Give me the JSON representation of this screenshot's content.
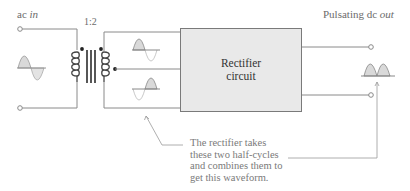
{
  "diagram": {
    "input_label": {
      "prefix": "ac ",
      "italic": "in"
    },
    "output_label": {
      "prefix": "Pulsating dc ",
      "italic": "out"
    },
    "transformer_ratio": "1:2",
    "rectifier": {
      "line1": "Rectifier",
      "line2": "circuit"
    },
    "annotation": [
      "The rectifier takes",
      "these two half-cycles",
      "and combines them to",
      "get this waveform."
    ],
    "colors": {
      "line": "#8a8a8a",
      "box_fill": "#e9e9e9",
      "box_stroke": "#7a7a7a",
      "wave_fill": "#d9d9d9",
      "text": "#6b6b6b"
    }
  }
}
